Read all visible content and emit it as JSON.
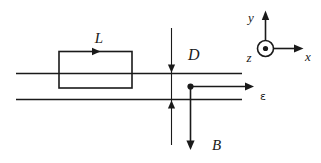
{
  "figure": {
    "kind": "physics-schematic-diagram",
    "background_color": "#ffffff",
    "line_color": "#1a1a1a",
    "labels": {
      "loop_length": "L",
      "gap_distance": "D",
      "magnetic_field": "B",
      "strip_field": "ε",
      "axis_x": "x",
      "axis_y": "y",
      "axis_z": "z"
    },
    "annotations": {
      "loop_current_direction": "right",
      "magnetic_field_direction": "down",
      "strip_field_direction": "right",
      "z_axis_direction": "out-of-page"
    }
  }
}
